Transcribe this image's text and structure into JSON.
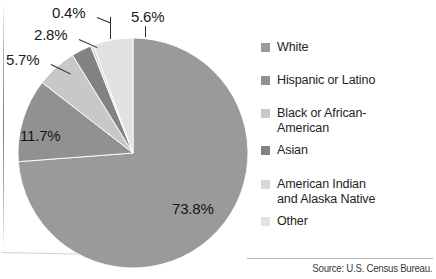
{
  "chart_data": {
    "type": "pie",
    "title": "",
    "categories": [
      "White",
      "Hispanic or Latino",
      "Black or African-American",
      "Asian",
      "American Indian and Alaska Native",
      "Other"
    ],
    "values": [
      73.8,
      11.7,
      5.7,
      2.8,
      0.4,
      5.6
    ],
    "value_labels": [
      "73.8%",
      "11.7%",
      "5.7%",
      "2.8%",
      "0.4%",
      "5.6%"
    ],
    "colors": [
      "#9a9a9a",
      "#919191",
      "#c8c8c8",
      "#828282",
      "#d8d8d8",
      "#e2e2e2"
    ],
    "units": "percent",
    "legend_position": "right",
    "start_angle_deg": 0,
    "direction": "clockwise",
    "grid": false
  },
  "legend": {
    "items": [
      {
        "label": "White",
        "color": "#9a9a9a"
      },
      {
        "label": "Hispanic or Latino",
        "color": "#919191"
      },
      {
        "label": "Black or African-\nAmerican",
        "line1": "Black or African-",
        "line2": "American",
        "color": "#c8c8c8"
      },
      {
        "label": "Asian",
        "color": "#828282"
      },
      {
        "label": "American Indian",
        "line1": "American Indian",
        "line2": "and Alaska Native",
        "color": "#d8d8d8"
      },
      {
        "label": "Other",
        "color": "#e2e2e2"
      }
    ]
  },
  "labels": {
    "white": "73.8%",
    "hispanic": "11.7%",
    "black": "5.7%",
    "asian": "2.8%",
    "american_indian": "0.4%",
    "other": "5.6%"
  },
  "source": {
    "text": "Source: U.S. Census Bureau."
  }
}
